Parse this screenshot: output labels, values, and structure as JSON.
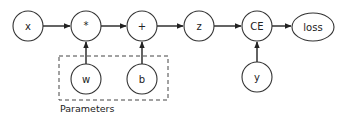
{
  "diagram": {
    "nodes": {
      "x": {
        "label": "x"
      },
      "mul": {
        "label": "*"
      },
      "add": {
        "label": "+"
      },
      "z": {
        "label": "z"
      },
      "ce": {
        "label": "CE"
      },
      "loss": {
        "label": "loss"
      },
      "w": {
        "label": "w"
      },
      "b": {
        "label": "b"
      },
      "y": {
        "label": "y"
      }
    },
    "edges": [
      {
        "from": "x",
        "to": "*"
      },
      {
        "from": "*",
        "to": "+"
      },
      {
        "from": "+",
        "to": "z"
      },
      {
        "from": "z",
        "to": "CE"
      },
      {
        "from": "CE",
        "to": "loss"
      },
      {
        "from": "w",
        "to": "*"
      },
      {
        "from": "b",
        "to": "+"
      },
      {
        "from": "y",
        "to": "CE"
      }
    ],
    "group": {
      "label": "Parameters",
      "members": [
        "w",
        "b"
      ]
    },
    "colors": {
      "stroke": "#333333",
      "background": "#ffffff",
      "text": "#222222"
    }
  }
}
